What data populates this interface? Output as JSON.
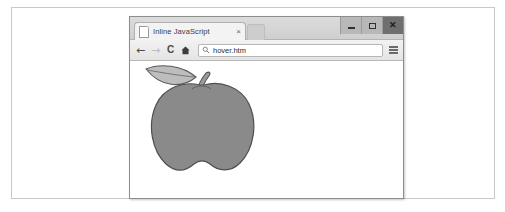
{
  "figure": {
    "background_color": "#ffffff",
    "border_color": "#c8c8c8"
  },
  "browser": {
    "titlebar": {
      "background_color": "#d5d5d5",
      "window_controls": [
        {
          "name": "minimize",
          "glyph": "—",
          "label": "Minimize"
        },
        {
          "name": "maximize",
          "glyph": "□",
          "label": "Maximize"
        },
        {
          "name": "close",
          "glyph": "✕",
          "label": "Close",
          "background_color": "#6f6f6f"
        }
      ]
    },
    "tabs": [
      {
        "title": "Inline JavaScript",
        "favicon": "page-icon",
        "close_glyph": "×",
        "active": true
      }
    ],
    "toolbar": {
      "back_label": "←",
      "forward_label": "→",
      "reload_label": "C",
      "home_label": "⌂",
      "menu_label": "hamburger-menu",
      "omnibox": {
        "value": "hover.htm",
        "placeholder": "Search or type URL",
        "search_icon": "magnifier-icon"
      }
    },
    "content": {
      "illustration": {
        "name": "apple-illustration",
        "body_fill": "#8a8a8a",
        "body_stroke": "#4f4f4f",
        "leaf_fill": "#bdbdbd",
        "leaf_stroke": "#5a5a5a",
        "stem_fill": "#9a9a9a",
        "stem_stroke": "#545454",
        "alt_text": "Gray apple with stem and leaf"
      }
    }
  }
}
